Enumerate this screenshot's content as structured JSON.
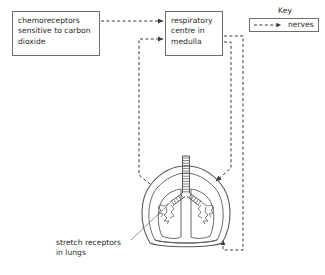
{
  "diagram": {
    "boxes": [
      {
        "id": "chemoreceptors",
        "text": "chemoreceptors\nsensitive to carbon\ndioxide"
      },
      {
        "id": "respiratory_centre",
        "text": "respiratory\ncentre in\nmedulla"
      }
    ],
    "labels": [
      {
        "id": "stretch_receptors",
        "text": "stretch receptors\nin lungs"
      }
    ],
    "key": {
      "title": "Key",
      "entries": [
        {
          "symbol": "dashed-arrow",
          "label": "nerves"
        }
      ]
    },
    "organ": {
      "name": "lungs",
      "parts": [
        "trachea",
        "bronchi",
        "alveoli",
        "diaphragm"
      ]
    },
    "connections": [
      {
        "from": "chemoreceptors",
        "to": "respiratory_centre",
        "type": "nerves"
      },
      {
        "from": "stretch_receptors",
        "to": "respiratory_centre",
        "type": "nerves"
      },
      {
        "from": "respiratory_centre",
        "to": "lungs",
        "type": "nerves"
      },
      {
        "from": "respiratory_centre",
        "to": "diaphragm",
        "type": "nerves"
      }
    ],
    "colors": {
      "stroke": "#6e6e6e",
      "text": "#2b2b2b",
      "background": "#ffffff",
      "organ_stroke": "#585858"
    }
  }
}
